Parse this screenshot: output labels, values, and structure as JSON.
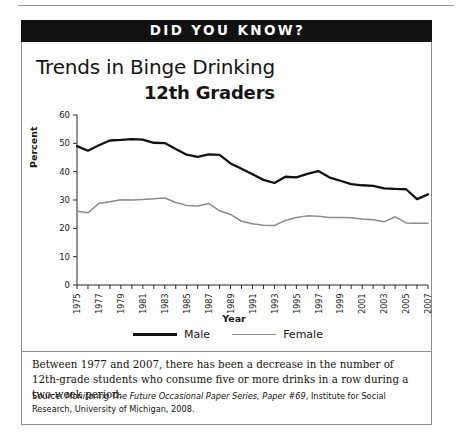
{
  "banner": {
    "title": "DID YOU KNOW?"
  },
  "headings": {
    "title_line1": "Trends in Binge Drinking",
    "title_line2": "12th Graders"
  },
  "legend": {
    "male_label": "Male",
    "female_label": "Female"
  },
  "caption": {
    "text": "Between 1977 and 2007, there has been a decrease in the number of 12th-grade students who consume five or more drinks in a row during a two-week period."
  },
  "source": {
    "prefix": "Source: ",
    "italic_title": "Monitoring The Future Occasional Paper Series, Paper #69",
    "suffix": ", Institute for Social Research, University of Michigan, 2008."
  },
  "chart_data": {
    "type": "line",
    "xlabel": "Year",
    "ylabel": "Percent",
    "ylim": [
      0,
      60
    ],
    "yticks": [
      0,
      10,
      20,
      30,
      40,
      50,
      60
    ],
    "xlim": [
      1975,
      2007
    ],
    "xticks_labeled": [
      1975,
      1977,
      1979,
      1981,
      1983,
      1985,
      1987,
      1989,
      1991,
      1993,
      1995,
      1997,
      1999,
      2001,
      2003,
      2005,
      2007
    ],
    "grid": false,
    "legend_position": "bottom",
    "x": [
      1975,
      1976,
      1977,
      1978,
      1979,
      1980,
      1981,
      1982,
      1983,
      1984,
      1985,
      1986,
      1987,
      1988,
      1989,
      1990,
      1991,
      1992,
      1993,
      1994,
      1995,
      1996,
      1997,
      1998,
      1999,
      2000,
      2001,
      2002,
      2003,
      2004,
      2005,
      2006,
      2007
    ],
    "series": [
      {
        "name": "Male",
        "color": "#111111",
        "values": [
          49.0,
          47.4,
          49.3,
          51.0,
          51.2,
          51.5,
          51.3,
          50.2,
          50.1,
          48.0,
          46.0,
          45.2,
          46.1,
          45.9,
          42.9,
          41.0,
          39.1,
          37.1,
          36.0,
          38.2,
          38.0,
          39.2,
          40.2,
          38.0,
          36.8,
          35.6,
          35.2,
          35.0,
          34.1,
          33.9,
          33.8,
          30.3,
          32.0
        ]
      },
      {
        "name": "Female",
        "color": "#8c8c8c",
        "values": [
          26.0,
          25.5,
          28.8,
          29.4,
          30.1,
          30.0,
          30.2,
          30.4,
          30.7,
          29.1,
          28.1,
          27.9,
          28.8,
          26.2,
          24.9,
          22.5,
          21.6,
          21.1,
          21.0,
          22.8,
          23.8,
          24.4,
          24.3,
          23.8,
          23.8,
          23.7,
          23.3,
          23.0,
          22.3,
          24.1,
          21.9,
          21.8,
          21.8
        ]
      }
    ]
  }
}
